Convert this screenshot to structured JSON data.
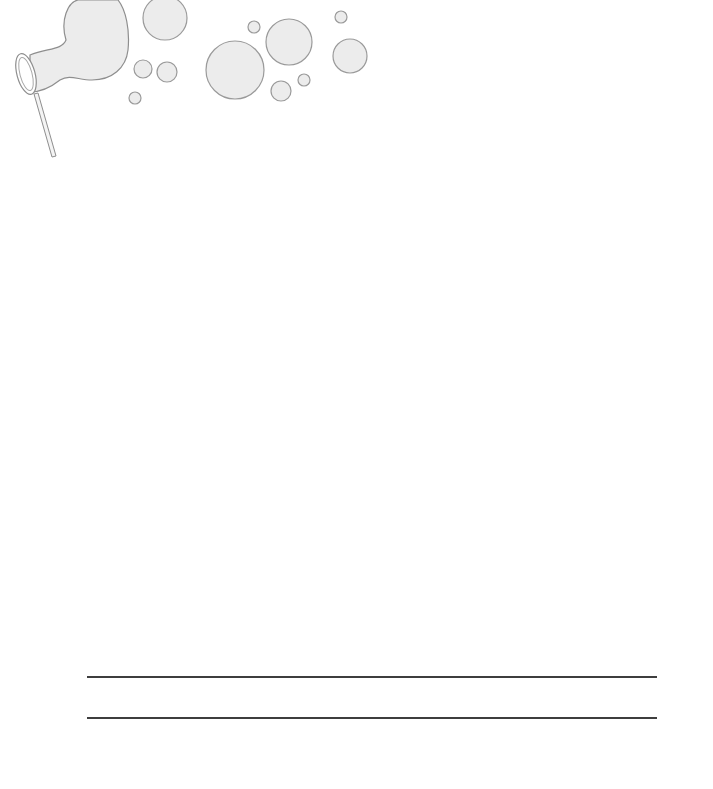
{
  "page": {
    "background": "#ffffff",
    "decoration": {
      "icon": "bubble-wand-icon",
      "bubble_fill": "#ececec",
      "bubble_stroke": "#9a9a9a",
      "bubbles": [
        {
          "cx": 165,
          "cy": 18,
          "r": 22
        },
        {
          "cx": 143,
          "cy": 69,
          "r": 9
        },
        {
          "cx": 167,
          "cy": 72,
          "r": 10
        },
        {
          "cx": 135,
          "cy": 98,
          "r": 6
        },
        {
          "cx": 235,
          "cy": 70,
          "r": 29
        },
        {
          "cx": 289,
          "cy": 42,
          "r": 23
        },
        {
          "cx": 254,
          "cy": 27,
          "r": 6
        },
        {
          "cx": 281,
          "cy": 91,
          "r": 10
        },
        {
          "cx": 304,
          "cy": 80,
          "r": 6
        },
        {
          "cx": 350,
          "cy": 56,
          "r": 17
        },
        {
          "cx": 341,
          "cy": 17,
          "r": 6
        }
      ]
    },
    "writing_lines": [
      {
        "y": 676,
        "color": "#3e3e3e"
      },
      {
        "y": 717,
        "color": "#3e3e3e"
      }
    ]
  }
}
